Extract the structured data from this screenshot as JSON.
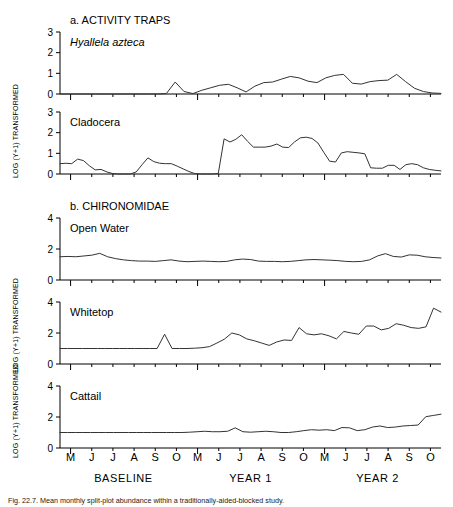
{
  "figure": {
    "sections": [
      {
        "id": "activity-traps",
        "label": "a. ACTIVITY TRAPS"
      },
      {
        "id": "chironomidae",
        "label": "b. CHIRONOMIDAE"
      }
    ],
    "y_axis_label": "LOG (Y+1) TRANSFORMED",
    "x_tick_labels": [
      "M",
      "J",
      "J",
      "A",
      "S",
      "O",
      "M",
      "J",
      "J",
      "A",
      "S",
      "O",
      "M",
      "J",
      "J",
      "A",
      "S",
      "O"
    ],
    "period_labels": [
      "BASELINE",
      "YEAR 1",
      "YEAR 2"
    ],
    "caption": "Fig. 22.7.  Mean monthly split-plot abundance within a traditionally-aided-blocked study.",
    "line_color": "#333333",
    "axis_color": "#000000"
  },
  "chart_data": [
    {
      "type": "line",
      "title": "Hyallela azteca",
      "panel": 1,
      "xlabel": "",
      "ylabel": "LOG (Y+1) TRANSFORMED",
      "ylim": [
        0,
        3
      ],
      "yticks": [
        0,
        1,
        2,
        3
      ],
      "grid": false,
      "x": [
        "M1",
        "J1",
        "J1b",
        "A1",
        "S1",
        "O1",
        "M2",
        "J2",
        "J2b",
        "A2",
        "S2",
        "O2",
        "M3",
        "J3",
        "J3b",
        "A3",
        "S3",
        "O3"
      ],
      "x_samples": 36,
      "values": [
        0,
        0,
        0,
        0,
        0,
        0,
        0,
        0,
        0,
        0,
        0,
        0,
        0.02,
        0.58,
        0.12,
        0.02,
        0.18,
        0.3,
        0.42,
        0.47,
        0.3,
        0.1,
        0.38,
        0.55,
        0.58,
        0.72,
        0.85,
        0.78,
        0.62,
        0.55,
        0.78,
        0.9,
        0.95,
        0.52,
        0.48,
        0.6,
        0.65,
        0.67,
        0.95,
        0.6,
        0.28,
        0.12,
        0.05,
        0.03
      ]
    },
    {
      "type": "line",
      "title": "Cladocera",
      "panel": 2,
      "xlabel": "",
      "ylabel": "LOG (Y+1) TRANSFORMED",
      "ylim": [
        0,
        3
      ],
      "yticks": [
        0,
        1,
        2,
        3
      ],
      "grid": false,
      "x_samples": 44,
      "values": [
        0.5,
        0.52,
        0.5,
        0.72,
        0.65,
        0.4,
        0.2,
        0.22,
        0.1,
        0.02,
        0,
        0,
        0,
        0.1,
        0.45,
        0.78,
        0.6,
        0.52,
        0.5,
        0.5,
        0.38,
        0.25,
        0.12,
        0.02,
        0,
        0,
        0,
        0.02,
        1.7,
        1.55,
        1.68,
        1.9,
        1.58,
        1.3,
        1.3,
        1.3,
        1.35,
        1.45,
        1.3,
        1.28,
        1.55,
        1.75,
        1.78,
        1.72,
        1.5,
        1.05,
        0.62,
        0.58,
        1.02,
        1.08,
        1.05,
        1.02,
        0.98,
        0.3,
        0.28,
        0.28,
        0.42,
        0.42,
        0.22,
        0.45,
        0.5,
        0.45,
        0.3,
        0.22,
        0.18,
        0.15
      ]
    },
    {
      "type": "line",
      "title": "Open Water",
      "panel": 3,
      "xlabel": "",
      "ylabel": "LOG (Y+1) TRANSFORMED",
      "ylim": [
        0,
        4
      ],
      "yticks": [
        0,
        2,
        4
      ],
      "grid": false,
      "x_samples": 44,
      "values": [
        1.5,
        1.52,
        1.5,
        1.55,
        1.6,
        1.72,
        1.5,
        1.38,
        1.3,
        1.25,
        1.22,
        1.22,
        1.2,
        1.25,
        1.3,
        1.22,
        1.18,
        1.2,
        1.22,
        1.2,
        1.18,
        1.2,
        1.3,
        1.35,
        1.32,
        1.22,
        1.2,
        1.2,
        1.18,
        1.2,
        1.25,
        1.3,
        1.32,
        1.3,
        1.28,
        1.25,
        1.2,
        1.18,
        1.2,
        1.3,
        1.55,
        1.7,
        1.52,
        1.48,
        1.62,
        1.6,
        1.5,
        1.45,
        1.42
      ]
    },
    {
      "type": "line",
      "title": "Whitetop",
      "panel": 4,
      "xlabel": "",
      "ylabel": "LOG (Y+1) TRANSFORMED",
      "ylim": [
        0,
        4
      ],
      "yticks": [
        0,
        2,
        4
      ],
      "grid": false,
      "x_samples": 44,
      "values": [
        1.0,
        1.0,
        1.0,
        1.0,
        1.0,
        1.0,
        1.0,
        1.0,
        1.0,
        1.0,
        1.0,
        1.0,
        1.0,
        1.0,
        1.92,
        1.0,
        1.0,
        1.0,
        1.02,
        1.05,
        1.12,
        1.35,
        1.6,
        2.0,
        1.88,
        1.62,
        1.5,
        1.35,
        1.2,
        1.42,
        1.55,
        1.52,
        2.35,
        1.95,
        1.88,
        1.95,
        1.82,
        1.62,
        2.1,
        2.0,
        1.92,
        2.45,
        2.45,
        2.2,
        2.3,
        2.6,
        2.5,
        2.35,
        2.3,
        2.4,
        3.6,
        3.35
      ]
    },
    {
      "type": "line",
      "title": "Cattail",
      "panel": 5,
      "xlabel": "",
      "ylabel": "LOG (Y+1) TRANSFORMED",
      "ylim": [
        0,
        4
      ],
      "yticks": [
        0,
        2,
        4
      ],
      "grid": false,
      "x_samples": 44,
      "values": [
        1.0,
        1.0,
        1.0,
        1.0,
        1.0,
        1.0,
        1.0,
        1.0,
        1.0,
        1.0,
        1.0,
        1.0,
        1.0,
        1.0,
        1.0,
        1.0,
        1.0,
        1.02,
        1.05,
        1.08,
        1.05,
        1.05,
        1.08,
        1.3,
        1.05,
        1.02,
        1.05,
        1.08,
        1.05,
        1.0,
        1.0,
        1.05,
        1.12,
        1.18,
        1.15,
        1.18,
        1.12,
        1.32,
        1.3,
        1.12,
        1.18,
        1.35,
        1.42,
        1.32,
        1.35,
        1.42,
        1.45,
        1.48,
        2.02,
        2.1,
        2.18
      ]
    }
  ]
}
